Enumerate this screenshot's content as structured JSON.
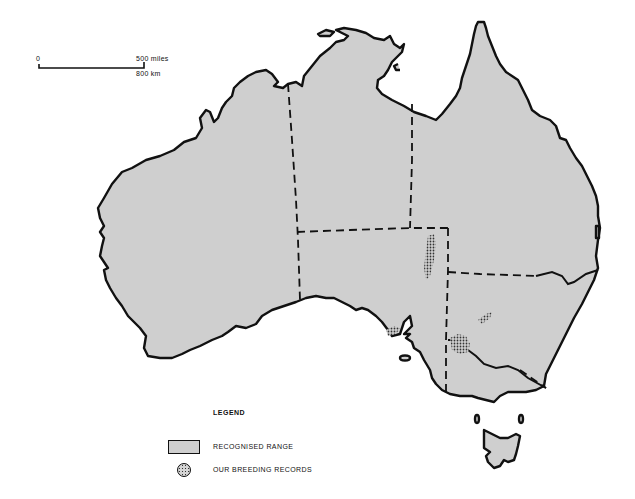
{
  "scale_bar": {
    "start_label": "0",
    "miles_label": "500 miles",
    "km_label": "800 km"
  },
  "legend": {
    "title": "LEGEND",
    "items": [
      {
        "label": "RECOGNISED RANGE",
        "symbol": "grey-filled-rectangle",
        "color": "#cfcfcf"
      },
      {
        "label": "OUR BREEDING RECORDS",
        "symbol": "stippled-circle",
        "color": "#333333"
      }
    ]
  },
  "map": {
    "region": "Australia",
    "land_fill": "#cfcfcf",
    "outline_color": "#111111",
    "breeding_record_areas": [
      {
        "location": "eastern South Australia (inland, north)",
        "shape": "elongated patch"
      },
      {
        "location": "Eyre Peninsula, South Australia",
        "shape": "small patch"
      },
      {
        "location": "central New South Wales",
        "shape": "small patch"
      },
      {
        "location": "Murray River, SA/NSW/Victoria border",
        "shape": "patch"
      }
    ]
  }
}
